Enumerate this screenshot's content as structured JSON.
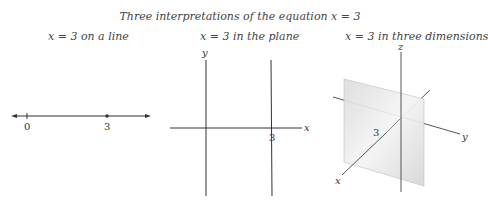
{
  "title": "Three interpretations of the equation x = 3",
  "panels": [
    {
      "caption": "x = 3 on a line",
      "labels": {
        "zero": "0",
        "three": "3"
      }
    },
    {
      "caption": "x = 3 in the plane",
      "labels": {
        "x_axis": "x",
        "y_axis": "y",
        "three": "3"
      }
    },
    {
      "caption": "x = 3 in three dimensions",
      "labels": {
        "x_axis": "x",
        "y_axis": "y",
        "z_axis": "z",
        "three": "3"
      }
    }
  ],
  "colors": {
    "line": "#333333",
    "plane": "#e4e4e4"
  }
}
